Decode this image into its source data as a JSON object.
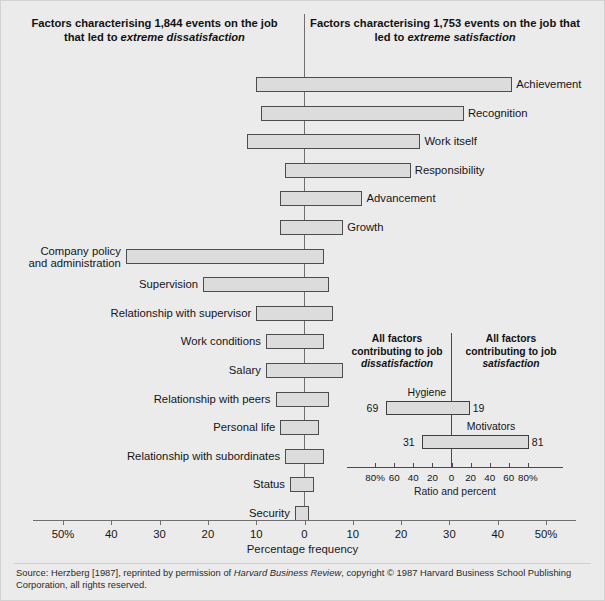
{
  "headers": {
    "left_pre": "Factors characterising 1,844 events on the job that led to ",
    "left_em": "extreme dissatisfaction",
    "right_pre": "Factors characterising 1,753 events on the job that led to ",
    "right_em": "extreme satisfaction"
  },
  "axis": {
    "title": "Percentage frequency",
    "ticks": [
      "50%",
      "40",
      "30",
      "20",
      "10",
      "0",
      "10",
      "20",
      "30",
      "40",
      "50%"
    ]
  },
  "inset": {
    "header_left_pre": "All factors contributing to job ",
    "header_left_em": "dissatisfaction",
    "header_right_pre": "All factors contributing to job ",
    "header_right_em": "satisfaction",
    "title": "Ratio and percent",
    "ticks": [
      "80%",
      "60",
      "40",
      "20",
      "0",
      "20",
      "40",
      "60",
      "80%"
    ],
    "rows": [
      {
        "name": "Hygiene",
        "left_label": "69",
        "right_label": "19",
        "left": 69,
        "right": 19
      },
      {
        "name": "Motivators",
        "left_label": "31",
        "right_label": "81",
        "left": 31,
        "right": 81
      }
    ]
  },
  "footer": {
    "pre": "Source: Herzberg [1987], reprinted by permission of ",
    "em": "Harvard Business Review",
    "post": ", copyright © 1987 Harvard Business School Publishing Corporation, all rights reserved."
  },
  "chart_data": {
    "type": "bar",
    "subtitle": "Factors characterising 1,844 events leading to extreme dissatisfaction and 1,753 events leading to extreme satisfaction",
    "orientation": "horizontal-diverging",
    "xlabel": "Percentage frequency",
    "ylabel": "",
    "xlim": [
      -50,
      50
    ],
    "xticks": [
      -50,
      -40,
      -30,
      -20,
      -10,
      0,
      10,
      20,
      30,
      40,
      50
    ],
    "xticklabels": [
      "50%",
      "40",
      "30",
      "20",
      "10",
      "0",
      "10",
      "20",
      "30",
      "40",
      "50%"
    ],
    "grid": false,
    "legend": "none",
    "note": "Negative (left) values = frequency for extreme dissatisfaction; positive (right) values = frequency for extreme satisfaction",
    "categories": [
      "Achievement",
      "Recognition",
      "Work itself",
      "Responsibility",
      "Advancement",
      "Growth",
      "Company policy and administration",
      "Supervision",
      "Relationship with supervisor",
      "Work conditions",
      "Salary",
      "Relationship with peers",
      "Personal life",
      "Relationship with subordinates",
      "Status",
      "Security"
    ],
    "series": [
      {
        "name": "Extreme dissatisfaction (left)",
        "values": [
          10,
          9,
          12,
          4,
          5,
          5,
          37,
          21,
          10,
          8,
          8,
          6,
          5,
          4,
          3,
          2
        ]
      },
      {
        "name": "Extreme satisfaction (right)",
        "values": [
          43,
          33,
          24,
          22,
          12,
          8,
          4,
          5,
          6,
          4,
          8,
          5,
          3,
          4,
          2,
          1
        ]
      }
    ],
    "rows": [
      {
        "label": "Achievement",
        "left": 10,
        "right": 43,
        "label_side": "right"
      },
      {
        "label": "Recognition",
        "left": 9,
        "right": 33,
        "label_side": "right"
      },
      {
        "label": "Work itself",
        "left": 12,
        "right": 24,
        "label_side": "right"
      },
      {
        "label": "Responsibility",
        "left": 4,
        "right": 22,
        "label_side": "right"
      },
      {
        "label": "Advancement",
        "left": 5,
        "right": 12,
        "label_side": "right"
      },
      {
        "label": "Growth",
        "left": 5,
        "right": 8,
        "label_side": "right"
      },
      {
        "label": "Company policy and administration",
        "left": 37,
        "right": 4,
        "label_side": "left"
      },
      {
        "label": "Supervision",
        "left": 21,
        "right": 5,
        "label_side": "left"
      },
      {
        "label": "Relationship with supervisor",
        "left": 10,
        "right": 6,
        "label_side": "left"
      },
      {
        "label": "Work conditions",
        "left": 8,
        "right": 4,
        "label_side": "left"
      },
      {
        "label": "Salary",
        "left": 8,
        "right": 8,
        "label_side": "left"
      },
      {
        "label": "Relationship with peers",
        "left": 6,
        "right": 5,
        "label_side": "left"
      },
      {
        "label": "Personal life",
        "left": 5,
        "right": 3,
        "label_side": "left"
      },
      {
        "label": "Relationship with subordinates",
        "left": 4,
        "right": 4,
        "label_side": "left"
      },
      {
        "label": "Status",
        "left": 3,
        "right": 2,
        "label_side": "left"
      },
      {
        "label": "Security",
        "left": 2,
        "right": 1,
        "label_side": "left"
      }
    ],
    "inset_chart": {
      "type": "bar",
      "orientation": "horizontal-diverging",
      "title": "Ratio and percent",
      "xlim": [
        -100,
        100
      ],
      "xticks": [
        -80,
        -60,
        -40,
        -20,
        0,
        20,
        40,
        60,
        80
      ],
      "xticklabels": [
        "80%",
        "60",
        "40",
        "20",
        "0",
        "20",
        "40",
        "60",
        "80%"
      ],
      "categories": [
        "Hygiene",
        "Motivators"
      ],
      "series": [
        {
          "name": "Contributing to job dissatisfaction (left)",
          "values": [
            69,
            31
          ]
        },
        {
          "name": "Contributing to job satisfaction (right)",
          "values": [
            19,
            81
          ]
        }
      ]
    }
  }
}
